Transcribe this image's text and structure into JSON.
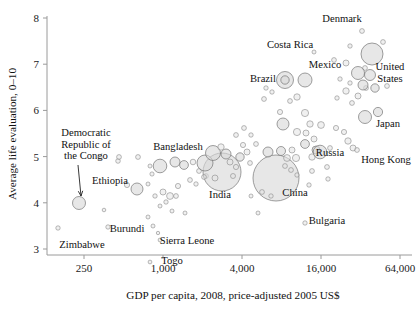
{
  "chart_data": {
    "type": "scatter",
    "title": "",
    "xlabel": "GDP per capita, 2008, price-adjusted 2005 US$",
    "ylabel": "Average life evaluation, 0–10",
    "xscale": "log",
    "xlim": [
      150,
      90000
    ],
    "ylim": [
      2.75,
      8.1
    ],
    "grid": false,
    "legend": null,
    "bubble_meaning": "bubble area proportional to population",
    "xticks": [
      "250",
      "1,000",
      "4,000",
      "16,000",
      "64,000"
    ],
    "xtick_values": [
      250,
      1000,
      4000,
      16000,
      64000
    ],
    "yticks": [
      "3",
      "4",
      "5",
      "6",
      "7",
      "8"
    ],
    "ytick_values": [
      3,
      4,
      5,
      6,
      7,
      8
    ],
    "annotations": [
      {
        "label": "Denmark",
        "x": 342,
        "y": 22,
        "anchor": "middle"
      },
      {
        "label": "Costa Rica",
        "x": 290,
        "y": 48,
        "anchor": "middle"
      },
      {
        "label": "Mexico",
        "x": 325,
        "y": 68,
        "anchor": "middle"
      },
      {
        "label": "United",
        "x": 390,
        "y": 70,
        "anchor": "middle"
      },
      {
        "label": "States",
        "x": 390,
        "y": 82,
        "anchor": "middle"
      },
      {
        "label": "Brazil",
        "x": 263,
        "y": 82,
        "anchor": "middle"
      },
      {
        "label": "Japan",
        "x": 388,
        "y": 127,
        "anchor": "middle"
      },
      {
        "label": "Russia",
        "x": 330,
        "y": 156,
        "anchor": "middle"
      },
      {
        "label": "Hong Kong",
        "x": 386,
        "y": 163,
        "anchor": "middle"
      },
      {
        "label": "Bangladesh",
        "x": 178,
        "y": 150,
        "anchor": "middle"
      },
      {
        "label": "India",
        "x": 220,
        "y": 198,
        "anchor": "middle"
      },
      {
        "label": "China",
        "x": 295,
        "y": 196,
        "anchor": "middle"
      },
      {
        "label": "Ethiopia",
        "x": 110,
        "y": 184,
        "anchor": "middle"
      },
      {
        "label": "Burundi",
        "x": 127,
        "y": 232,
        "anchor": "middle"
      },
      {
        "label": "Zimbabwe",
        "x": 82,
        "y": 248,
        "anchor": "middle"
      },
      {
        "label": "Sierra Leone",
        "x": 187,
        "y": 244,
        "anchor": "middle"
      },
      {
        "label": "Togo",
        "x": 172,
        "y": 264,
        "anchor": "middle"
      },
      {
        "label": "Bulgaria",
        "x": 327,
        "y": 224,
        "anchor": "middle"
      }
    ],
    "callout": {
      "lines": [
        "Democratic",
        "Republic of",
        "the Congo"
      ],
      "x": 86,
      "y": 136,
      "target_x": 79,
      "target_y": 200
    },
    "points": [
      {
        "label": "Democratic Republic of the Congo",
        "px": 79,
        "py": 203,
        "r": 6.5,
        "big": true
      },
      {
        "label": "Zimbabwe",
        "px": 58,
        "py": 228,
        "r": 2.2,
        "big": false
      },
      {
        "label": "Burundi",
        "px": 108,
        "py": 227,
        "r": 2.2,
        "big": false
      },
      {
        "label": "",
        "px": 104,
        "py": 210,
        "r": 1.8,
        "big": false
      },
      {
        "label": "Ethiopia",
        "px": 137,
        "py": 189,
        "r": 6.0,
        "big": true
      },
      {
        "label": "",
        "px": 127,
        "py": 185,
        "r": 2.6,
        "big": false
      },
      {
        "label": "",
        "px": 118,
        "py": 161,
        "r": 2.3,
        "big": false
      },
      {
        "label": "",
        "px": 138,
        "py": 157,
        "r": 2.4,
        "big": false
      },
      {
        "label": "",
        "px": 150,
        "py": 166,
        "r": 2.0,
        "big": false
      },
      {
        "label": "",
        "px": 152,
        "py": 174,
        "r": 2.1,
        "big": false
      },
      {
        "label": "",
        "px": 148,
        "py": 184,
        "r": 2.0,
        "big": false
      },
      {
        "label": "",
        "px": 155,
        "py": 196,
        "r": 2.2,
        "big": false
      },
      {
        "label": "",
        "px": 163,
        "py": 192,
        "r": 3.0,
        "big": false
      },
      {
        "label": "",
        "px": 170,
        "py": 196,
        "r": 3.4,
        "big": false
      },
      {
        "label": "",
        "px": 176,
        "py": 196,
        "r": 2.4,
        "big": false
      },
      {
        "label": "",
        "px": 166,
        "py": 202,
        "r": 2.2,
        "big": false
      },
      {
        "label": "",
        "px": 160,
        "py": 206,
        "r": 2.0,
        "big": false
      },
      {
        "label": "Bangladesh",
        "px": 160,
        "py": 166,
        "r": 6.8,
        "big": true
      },
      {
        "label": "",
        "px": 175,
        "py": 162,
        "r": 5.0,
        "big": true
      },
      {
        "label": "",
        "px": 184,
        "py": 165,
        "r": 4.4,
        "big": true
      },
      {
        "label": "",
        "px": 148,
        "py": 217,
        "r": 2.0,
        "big": false
      },
      {
        "label": "",
        "px": 153,
        "py": 226,
        "r": 2.0,
        "big": false
      },
      {
        "label": "Sierra Leone",
        "px": 160,
        "py": 240,
        "r": 1.9,
        "big": false
      },
      {
        "label": "Togo",
        "px": 150,
        "py": 262,
        "r": 1.9,
        "big": false
      },
      {
        "label": "",
        "px": 158,
        "py": 233,
        "r": 1.7,
        "big": false
      },
      {
        "label": "",
        "px": 172,
        "py": 211,
        "r": 2.0,
        "big": false
      },
      {
        "label": "",
        "px": 185,
        "py": 213,
        "r": 2.0,
        "big": false
      },
      {
        "label": "",
        "px": 178,
        "py": 186,
        "r": 2.6,
        "big": false
      },
      {
        "label": "",
        "px": 190,
        "py": 180,
        "r": 2.4,
        "big": false
      },
      {
        "label": "",
        "px": 196,
        "py": 184,
        "r": 2.2,
        "big": false
      },
      {
        "label": "",
        "px": 199,
        "py": 171,
        "r": 2.4,
        "big": false
      },
      {
        "label": "",
        "px": 206,
        "py": 176,
        "r": 2.4,
        "big": false
      },
      {
        "label": "",
        "px": 193,
        "py": 162,
        "r": 2.8,
        "big": false
      },
      {
        "label": "India",
        "px": 222,
        "py": 172,
        "r": 19.0,
        "big": true
      },
      {
        "label": "",
        "px": 205,
        "py": 163,
        "r": 8.0,
        "big": true
      },
      {
        "label": "",
        "px": 213,
        "py": 153,
        "r": 7.5,
        "big": true
      },
      {
        "label": "",
        "px": 226,
        "py": 154,
        "r": 5.0,
        "big": true
      },
      {
        "label": "",
        "px": 221,
        "py": 147,
        "r": 3.2,
        "big": false
      },
      {
        "label": "",
        "px": 230,
        "py": 162,
        "r": 3.0,
        "big": false
      },
      {
        "label": "",
        "px": 236,
        "py": 167,
        "r": 2.6,
        "big": false
      },
      {
        "label": "",
        "px": 233,
        "py": 176,
        "r": 2.5,
        "big": false
      },
      {
        "label": "",
        "px": 215,
        "py": 178,
        "r": 3.0,
        "big": false
      },
      {
        "label": "",
        "px": 204,
        "py": 177,
        "r": 2.4,
        "big": false
      },
      {
        "label": "",
        "px": 240,
        "py": 157,
        "r": 4.2,
        "big": true
      },
      {
        "label": "",
        "px": 247,
        "py": 152,
        "r": 3.0,
        "big": false
      },
      {
        "label": "",
        "px": 243,
        "py": 145,
        "r": 2.6,
        "big": false
      },
      {
        "label": "",
        "px": 250,
        "py": 163,
        "r": 2.4,
        "big": false
      },
      {
        "label": "",
        "px": 236,
        "py": 135,
        "r": 2.4,
        "big": false
      },
      {
        "label": "",
        "px": 244,
        "py": 128,
        "r": 2.4,
        "big": false
      },
      {
        "label": "",
        "px": 251,
        "py": 135,
        "r": 2.2,
        "big": false
      },
      {
        "label": "",
        "px": 256,
        "py": 144,
        "r": 2.4,
        "big": false
      },
      {
        "label": "China",
        "px": 276,
        "py": 178,
        "r": 23.0,
        "big": true
      },
      {
        "label": "",
        "px": 268,
        "py": 152,
        "r": 5.0,
        "big": true
      },
      {
        "label": "",
        "px": 281,
        "py": 151,
        "r": 4.5,
        "big": true
      },
      {
        "label": "",
        "px": 287,
        "py": 158,
        "r": 3.4,
        "big": false
      },
      {
        "label": "",
        "px": 292,
        "py": 150,
        "r": 3.0,
        "big": false
      },
      {
        "label": "",
        "px": 296,
        "py": 158,
        "r": 3.6,
        "big": false
      },
      {
        "label": "",
        "px": 285,
        "py": 166,
        "r": 2.4,
        "big": false
      },
      {
        "label": "",
        "px": 291,
        "py": 170,
        "r": 2.4,
        "big": false
      },
      {
        "label": "",
        "px": 297,
        "py": 175,
        "r": 2.2,
        "big": false
      },
      {
        "label": "",
        "px": 262,
        "py": 192,
        "r": 2.4,
        "big": false
      },
      {
        "label": "",
        "px": 271,
        "py": 196,
        "r": 2.2,
        "big": false
      },
      {
        "label": "",
        "px": 251,
        "py": 196,
        "r": 2.0,
        "big": false
      },
      {
        "label": "",
        "px": 258,
        "py": 213,
        "r": 2.0,
        "big": false
      },
      {
        "label": "Bulgaria",
        "px": 305,
        "py": 223,
        "r": 2.2,
        "big": false
      },
      {
        "label": "",
        "px": 309,
        "py": 185,
        "r": 2.2,
        "big": false
      },
      {
        "label": "",
        "px": 328,
        "py": 179,
        "r": 2.2,
        "big": false
      },
      {
        "label": "",
        "px": 283,
        "py": 124,
        "r": 6.0,
        "big": true
      },
      {
        "label": "",
        "px": 297,
        "py": 132,
        "r": 3.6,
        "big": false
      },
      {
        "label": "",
        "px": 280,
        "py": 112,
        "r": 2.6,
        "big": false
      },
      {
        "label": "",
        "px": 305,
        "py": 113,
        "r": 3.6,
        "big": false
      },
      {
        "label": "",
        "px": 310,
        "py": 124,
        "r": 3.2,
        "big": false
      },
      {
        "label": "",
        "px": 306,
        "py": 133,
        "r": 3.0,
        "big": false
      },
      {
        "label": "",
        "px": 314,
        "py": 139,
        "r": 3.0,
        "big": false
      },
      {
        "label": "",
        "px": 305,
        "py": 144,
        "r": 4.4,
        "big": true
      },
      {
        "label": "",
        "px": 316,
        "py": 150,
        "r": 4.0,
        "big": true
      },
      {
        "label": "",
        "px": 312,
        "py": 157,
        "r": 3.2,
        "big": false
      },
      {
        "label": "",
        "px": 321,
        "py": 125,
        "r": 3.4,
        "big": false
      },
      {
        "label": "Russia",
        "px": 320,
        "py": 152,
        "r": 6.8,
        "big": true
      },
      {
        "label": "",
        "px": 330,
        "py": 148,
        "r": 2.4,
        "big": false
      },
      {
        "label": "",
        "px": 327,
        "py": 167,
        "r": 2.4,
        "big": false
      },
      {
        "label": "",
        "px": 312,
        "py": 171,
        "r": 2.4,
        "big": false
      },
      {
        "label": "",
        "px": 336,
        "py": 128,
        "r": 2.6,
        "big": false
      },
      {
        "label": "",
        "px": 344,
        "py": 132,
        "r": 2.6,
        "big": false
      },
      {
        "label": "",
        "px": 348,
        "py": 141,
        "r": 3.2,
        "big": false
      },
      {
        "label": "",
        "px": 353,
        "py": 148,
        "r": 3.0,
        "big": false
      },
      {
        "label": "",
        "px": 352,
        "py": 103,
        "r": 2.4,
        "big": false
      },
      {
        "label": "",
        "px": 358,
        "py": 96,
        "r": 3.0,
        "big": false
      },
      {
        "label": "",
        "px": 346,
        "py": 91,
        "r": 3.2,
        "big": false
      },
      {
        "label": "",
        "px": 366,
        "py": 88,
        "r": 2.4,
        "big": false
      },
      {
        "label": "Japan",
        "px": 365,
        "py": 117,
        "r": 6.5,
        "big": true
      },
      {
        "label": "Hong Kong",
        "px": 357,
        "py": 150,
        "r": 2.4,
        "big": false
      },
      {
        "label": "Brazil",
        "px": 285,
        "py": 80,
        "r": 8.5,
        "big": true
      },
      {
        "label": "",
        "px": 285,
        "py": 80,
        "r": 4.2,
        "big": true
      },
      {
        "label": "Mexico",
        "px": 305,
        "py": 80,
        "r": 7.0,
        "big": true
      },
      {
        "label": "Costa Rica",
        "px": 314,
        "py": 52,
        "r": 2.0,
        "big": false
      },
      {
        "label": "",
        "px": 297,
        "py": 97,
        "r": 3.2,
        "big": false
      },
      {
        "label": "",
        "px": 290,
        "py": 101,
        "r": 2.4,
        "big": false
      },
      {
        "label": "",
        "px": 272,
        "py": 92,
        "r": 2.2,
        "big": false
      },
      {
        "label": "",
        "px": 264,
        "py": 99,
        "r": 2.4,
        "big": false
      },
      {
        "label": "",
        "px": 266,
        "py": 88,
        "r": 2.2,
        "big": false
      },
      {
        "label": "United States",
        "px": 372,
        "py": 54,
        "r": 11.0,
        "big": true
      },
      {
        "label": "",
        "px": 365,
        "py": 68,
        "r": 2.4,
        "big": false
      },
      {
        "label": "",
        "px": 383,
        "py": 42,
        "r": 2.4,
        "big": false
      },
      {
        "label": "Denmark",
        "px": 362,
        "py": 31,
        "r": 2.4,
        "big": false
      },
      {
        "label": "",
        "px": 350,
        "py": 46,
        "r": 2.2,
        "big": false
      },
      {
        "label": "",
        "px": 346,
        "py": 63,
        "r": 3.0,
        "big": false
      },
      {
        "label": "",
        "px": 358,
        "py": 73,
        "r": 6.5,
        "big": true
      },
      {
        "label": "",
        "px": 370,
        "py": 75,
        "r": 5.5,
        "big": true
      },
      {
        "label": "",
        "px": 363,
        "py": 85,
        "r": 5.0,
        "big": true
      },
      {
        "label": "",
        "px": 375,
        "py": 88,
        "r": 4.2,
        "big": true
      },
      {
        "label": "",
        "px": 387,
        "py": 86,
        "r": 2.4,
        "big": false
      },
      {
        "label": "",
        "px": 350,
        "py": 83,
        "r": 2.2,
        "big": false
      },
      {
        "label": "",
        "px": 340,
        "py": 79,
        "r": 2.2,
        "big": false
      },
      {
        "label": "",
        "px": 334,
        "py": 60,
        "r": 2.4,
        "big": false
      },
      {
        "label": "",
        "px": 337,
        "py": 98,
        "r": 2.2,
        "big": false
      },
      {
        "label": "",
        "px": 378,
        "py": 112,
        "r": 4.6,
        "big": true
      },
      {
        "label": "",
        "px": 100,
        "py": 157,
        "r": 2.2,
        "big": false
      },
      {
        "label": "",
        "px": 119,
        "py": 157,
        "r": 2.4,
        "big": false
      }
    ]
  }
}
